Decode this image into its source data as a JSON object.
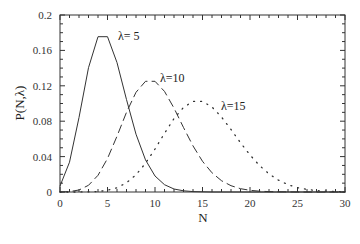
{
  "chart_data": {
    "type": "line",
    "title": "",
    "xlabel": "N",
    "ylabel": "P(N,λ)",
    "xlim": [
      0,
      30
    ],
    "ylim": [
      0,
      0.2
    ],
    "xticks": [
      0,
      5,
      10,
      15,
      20,
      25,
      30
    ],
    "xtick_labels": [
      "0",
      "5",
      "10",
      "15",
      "20",
      "25",
      "30"
    ],
    "yticks": [
      0,
      0.04,
      0.08,
      0.12,
      0.16,
      0.2
    ],
    "ytick_labels": [
      "0",
      "0.04",
      "0.08",
      "0.12",
      "0.16",
      "0.2"
    ],
    "grid": false,
    "legend": "none (inline annotations)",
    "x": [
      0,
      1,
      2,
      3,
      4,
      5,
      6,
      7,
      8,
      9,
      10,
      11,
      12,
      13,
      14,
      15,
      16,
      17,
      18,
      19,
      20,
      21,
      22,
      23,
      24,
      25,
      26,
      27,
      28,
      29,
      30
    ],
    "series": [
      {
        "name": "λ=5",
        "style": "solid",
        "annotation": "λ= 5",
        "values": [
          0.0067,
          0.0337,
          0.0842,
          0.1404,
          0.1755,
          0.1755,
          0.1462,
          0.1044,
          0.0653,
          0.0363,
          0.0181,
          0.0082,
          0.0034,
          0.0013,
          0.0005,
          0.0002,
          0.0,
          0.0,
          0.0,
          0.0,
          0.0,
          0.0,
          0.0,
          0.0,
          0.0,
          0.0,
          0.0,
          0.0,
          0.0,
          0.0,
          0.0
        ]
      },
      {
        "name": "λ=10",
        "style": "dashed",
        "annotation": "λ=10",
        "values": [
          0.0,
          0.0005,
          0.0023,
          0.0076,
          0.0189,
          0.0378,
          0.0631,
          0.0901,
          0.1126,
          0.1251,
          0.1251,
          0.1137,
          0.0948,
          0.0729,
          0.0521,
          0.0347,
          0.0217,
          0.0128,
          0.0071,
          0.0037,
          0.0019,
          0.0009,
          0.0004,
          0.0002,
          0.0001,
          0.0,
          0.0,
          0.0,
          0.0,
          0.0,
          0.0
        ]
      },
      {
        "name": "λ=15",
        "style": "dotted",
        "annotation": "λ=15",
        "values": [
          0.0,
          0.0,
          0.0,
          0.0002,
          0.0006,
          0.0019,
          0.0048,
          0.0104,
          0.0194,
          0.0324,
          0.0486,
          0.0663,
          0.0829,
          0.0956,
          0.1024,
          0.1024,
          0.096,
          0.0847,
          0.0706,
          0.0557,
          0.0418,
          0.0299,
          0.0204,
          0.0133,
          0.0083,
          0.005,
          0.0029,
          0.0016,
          0.0009,
          0.0004,
          0.0002
        ]
      }
    ]
  }
}
